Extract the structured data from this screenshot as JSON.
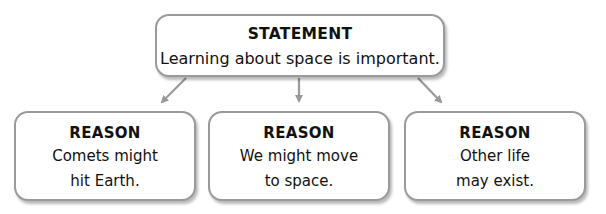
{
  "statement": {
    "title": "STATEMENT",
    "text": "Learning about space is important."
  },
  "reasons": [
    {
      "title": "REASON",
      "line1": "Comets might",
      "line2": "hit Earth."
    },
    {
      "title": "REASON",
      "line1": "We might move",
      "line2": "to space."
    },
    {
      "title": "REASON",
      "line1": "Other life",
      "line2": "may exist."
    }
  ],
  "colors": {
    "border": "#9a9a9a",
    "arrow": "#9a9a9a",
    "text": "#111111",
    "background": "#ffffff"
  }
}
